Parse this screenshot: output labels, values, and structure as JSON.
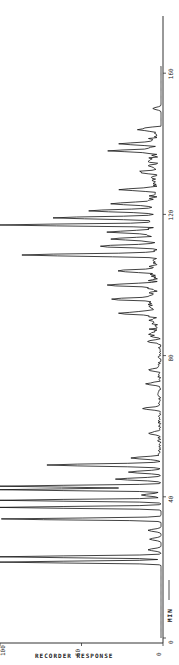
{
  "chart_data": {
    "type": "line",
    "orientation": "rotated-90",
    "title": "",
    "xlabel": "MIN",
    "ylabel": "RECORDER RESPONSE",
    "x_ticks": [
      0,
      40,
      80,
      120,
      160
    ],
    "y_ticks": [
      0,
      50,
      100
    ],
    "xlim": [
      0,
      160
    ],
    "ylim": [
      0,
      100
    ],
    "grid": false,
    "peaks": [
      {
        "t": 21.5,
        "response": 100
      },
      {
        "t": 23.0,
        "response": 100
      },
      {
        "t": 25.0,
        "response": 8
      },
      {
        "t": 28.0,
        "response": 7
      },
      {
        "t": 30.5,
        "response": 8
      },
      {
        "t": 33.7,
        "response": 100
      },
      {
        "t": 37.0,
        "response": 100
      },
      {
        "t": 39.0,
        "response": 100
      },
      {
        "t": 40.5,
        "response": 12
      },
      {
        "t": 42.0,
        "response": 100
      },
      {
        "t": 43.0,
        "response": 100
      },
      {
        "t": 45.0,
        "response": 28
      },
      {
        "t": 47.0,
        "response": 20
      },
      {
        "t": 49.0,
        "response": 70
      },
      {
        "t": 51.0,
        "response": 18
      },
      {
        "t": 58.0,
        "response": 7
      },
      {
        "t": 65.0,
        "response": 10
      },
      {
        "t": 72.0,
        "response": 8
      },
      {
        "t": 76.0,
        "response": 7
      },
      {
        "t": 84.0,
        "response": 8
      },
      {
        "t": 92.0,
        "response": 20
      },
      {
        "t": 96.0,
        "response": 25
      },
      {
        "t": 100.0,
        "response": 30
      },
      {
        "t": 104.0,
        "response": 22
      },
      {
        "t": 108.5,
        "response": 80
      },
      {
        "t": 111.0,
        "response": 35
      },
      {
        "t": 113.0,
        "response": 25
      },
      {
        "t": 115.0,
        "response": 30
      },
      {
        "t": 117.0,
        "response": 100
      },
      {
        "t": 119.0,
        "response": 60
      },
      {
        "t": 121.0,
        "response": 40
      },
      {
        "t": 123.0,
        "response": 28
      },
      {
        "t": 127.0,
        "response": 18
      },
      {
        "t": 132.0,
        "response": 10
      },
      {
        "t": 138.0,
        "response": 25
      },
      {
        "t": 140.0,
        "response": 22
      },
      {
        "t": 144.0,
        "response": 10
      },
      {
        "t": 150.0,
        "response": 5
      },
      {
        "t": 163.0,
        "response": 6
      }
    ]
  },
  "axis": {
    "time_label": "MIN",
    "response_label": "RECORDER RESPONSE",
    "time_ticks": [
      "0",
      "40",
      "80",
      "120",
      "160"
    ],
    "response_ticks": [
      "0",
      "50",
      "100"
    ]
  }
}
